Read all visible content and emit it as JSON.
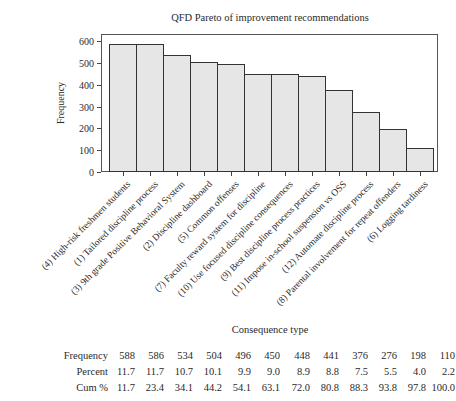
{
  "chart_data": {
    "type": "bar",
    "title": "QFD Pareto of improvement recommendations",
    "xlabel": "Consequence type",
    "ylabel": "Frequency",
    "ylim": [
      0,
      600
    ],
    "yticks": [
      0,
      100,
      200,
      300,
      400,
      500,
      600
    ],
    "grid": false,
    "legend": null,
    "categories": [
      "(4) High-risk freshmen students",
      "(1) Tailored discipline process",
      "(3) 9th grade Positive Behavioral System",
      "(2) Discipline dashboard",
      "(5) Common offenses",
      "(7) Faculty reward system for discipline",
      "(10) Use focused discipline consequences",
      "(9) Best discipline process practices",
      "(11) Impose in-school suspension vs OSS",
      "(12) Automate discipline process",
      "(8) Parental involvement for repeat offenders",
      "(6) Logging tardiness"
    ],
    "values": [
      588,
      586,
      534,
      504,
      496,
      450,
      448,
      441,
      376,
      276,
      198,
      110
    ],
    "table": {
      "rows": [
        {
          "label": "Frequency",
          "values": [
            "588",
            "586",
            "534",
            "504",
            "496",
            "450",
            "448",
            "441",
            "376",
            "276",
            "198",
            "110"
          ]
        },
        {
          "label": "Percent",
          "values": [
            "11.7",
            "11.7",
            "10.7",
            "10.1",
            "9.9",
            "9.0",
            "8.9",
            "8.8",
            "7.5",
            "5.5",
            "4.0",
            "2.2"
          ]
        },
        {
          "label": "Cum %",
          "values": [
            "11.7",
            "23.4",
            "34.1",
            "44.2",
            "54.1",
            "63.1",
            "72.0",
            "80.8",
            "88.3",
            "93.8",
            "97.8",
            "100.0"
          ]
        }
      ]
    }
  }
}
